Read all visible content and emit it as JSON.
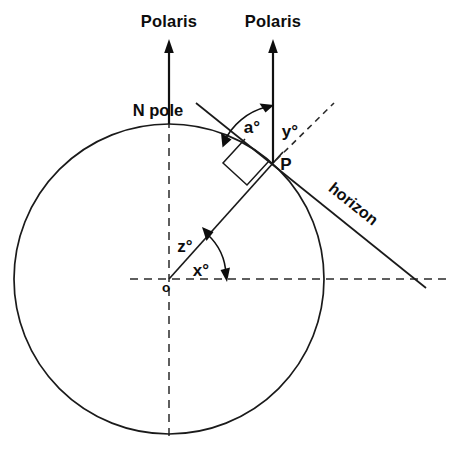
{
  "figure": {
    "background_color": "#ffffff",
    "ink_color": "#111111"
  },
  "labels": {
    "polaris_left": "Polaris",
    "polaris_right": "Polaris",
    "north_pole": "N pole",
    "point_p": "P",
    "origin": "o",
    "horizon": "horizon",
    "angle_a": "a°",
    "angle_y": "y°",
    "angle_z": "z°",
    "angle_x": "x°"
  },
  "caption": {
    "text": ""
  },
  "geometry": {
    "circle": {
      "center_x": 169,
      "center_y": 279,
      "radius": 155
    },
    "point_p": {
      "x": 273,
      "y": 163
    },
    "polaris_arrow_left": {
      "x": 169,
      "top_y": 42,
      "bottom_y": 124
    },
    "polaris_arrow_right": {
      "x": 273,
      "top_y": 42,
      "bottom_y": 163
    },
    "horizon_line": {
      "x1": 196,
      "y1": 103,
      "x2": 426,
      "y2": 288
    },
    "dashed_ray_from_p": {
      "x1": 273,
      "y1": 163,
      "x2": 334,
      "y2": 103
    },
    "vertical_axis": {
      "x": 169,
      "y1": 106,
      "y2": 442
    },
    "horizontal_axis": {
      "y": 279,
      "x1": 130,
      "x2": 448
    }
  }
}
